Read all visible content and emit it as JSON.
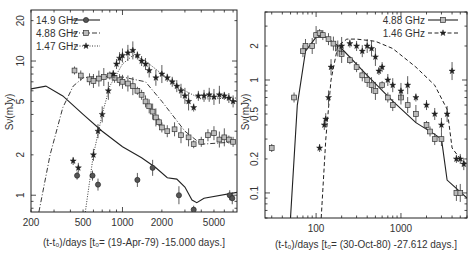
{
  "chart_data": [
    {
      "type": "scatter",
      "title": "",
      "xlabel": "(t-t0)/days [t0= (19-Apr-79) -15.000 days.]",
      "ylabel": "Sν(mJy)",
      "xscale": "log",
      "yscale": "log",
      "xlim": [
        200,
        7500
      ],
      "ylim": [
        0.75,
        24
      ],
      "xticks": [
        200,
        500,
        1000,
        2000,
        5000
      ],
      "xtick_labels": [
        "200",
        "500",
        "1000",
        "2000",
        "5000"
      ],
      "yticks": [
        1,
        2,
        5,
        10,
        20
      ],
      "ytick_labels": [
        "1",
        "2",
        "5",
        "10",
        "20"
      ],
      "grid": false,
      "legend_position": "upper left",
      "series": [
        {
          "name": "14.9 GHz",
          "marker": "circle",
          "line": "solid",
          "points": [
            [
              450,
              1.4
            ],
            [
              590,
              1.4
            ],
            [
              650,
              1.2
            ],
            [
              1300,
              1.3
            ],
            [
              1700,
              1.6
            ],
            [
              2700,
              1.0
            ],
            [
              3500,
              0.78
            ],
            [
              6600,
              1.0
            ],
            [
              6900,
              0.95
            ]
          ],
          "model": [
            [
              200,
              6.2
            ],
            [
              260,
              6.5
            ],
            [
              350,
              5.5
            ],
            [
              500,
              4.0
            ],
            [
              700,
              3.0
            ],
            [
              1000,
              2.3
            ],
            [
              1400,
              1.9
            ],
            [
              1800,
              1.6
            ],
            [
              2200,
              1.35
            ],
            [
              2600,
              1.32
            ],
            [
              3000,
              1.15
            ],
            [
              3400,
              0.92
            ],
            [
              3700,
              0.88
            ],
            [
              4200,
              0.95
            ],
            [
              7500,
              1.05
            ]
          ]
        },
        {
          "name": "4.88 GHz",
          "marker": "square",
          "line": "dashdot",
          "points": [
            [
              430,
              8.5
            ],
            [
              480,
              7.8
            ],
            [
              560,
              7.3
            ],
            [
              600,
              7.1
            ],
            [
              660,
              7.4
            ],
            [
              720,
              7.6
            ],
            [
              800,
              7.8
            ],
            [
              870,
              7.5
            ],
            [
              950,
              7.2
            ],
            [
              1000,
              7.0
            ],
            [
              1100,
              6.8
            ],
            [
              1200,
              6.5
            ],
            [
              1300,
              6.0
            ],
            [
              1400,
              5.6
            ],
            [
              1500,
              5.0
            ],
            [
              1600,
              4.6
            ],
            [
              1700,
              4.2
            ],
            [
              1800,
              3.8
            ],
            [
              1900,
              3.5
            ],
            [
              2000,
              3.2
            ],
            [
              2200,
              3.0
            ],
            [
              2500,
              3.1
            ],
            [
              2800,
              2.8
            ],
            [
              3200,
              2.7
            ],
            [
              3500,
              2.4
            ],
            [
              4000,
              2.5
            ],
            [
              4500,
              2.8
            ],
            [
              5000,
              2.9
            ],
            [
              5500,
              2.6
            ],
            [
              6000,
              2.7
            ],
            [
              6500,
              2.6
            ],
            [
              7000,
              2.5
            ]
          ],
          "model": [
            [
              230,
              0.75
            ],
            [
              280,
              2.0
            ],
            [
              350,
              4.5
            ],
            [
              420,
              6.5
            ],
            [
              500,
              7.5
            ],
            [
              650,
              7.7
            ],
            [
              1000,
              7.6
            ],
            [
              1500,
              7.0
            ],
            [
              2000,
              5.0
            ],
            [
              3000,
              3.0
            ],
            [
              4000,
              2.4
            ],
            [
              7500,
              2.5
            ]
          ]
        },
        {
          "name": "1.47 GHz",
          "marker": "star",
          "line": "dotted",
          "points": [
            [
              420,
              1.8
            ],
            [
              460,
              1.6
            ],
            [
              600,
              2.0
            ],
            [
              650,
              3.0
            ],
            [
              700,
              4.0
            ],
            [
              780,
              6.0
            ],
            [
              850,
              8.0
            ],
            [
              900,
              9.5
            ],
            [
              950,
              10.5
            ],
            [
              1000,
              11.0
            ],
            [
              1100,
              11.5
            ],
            [
              1200,
              12.0
            ],
            [
              1300,
              11.0
            ],
            [
              1400,
              10.0
            ],
            [
              1500,
              9.5
            ],
            [
              1600,
              8.5
            ],
            [
              1800,
              7.5
            ],
            [
              2000,
              8.0
            ],
            [
              2200,
              7.5
            ],
            [
              2400,
              7.0
            ],
            [
              2600,
              6.5
            ],
            [
              2800,
              6.0
            ],
            [
              3000,
              5.5
            ],
            [
              3200,
              5.0
            ],
            [
              3500,
              4.5
            ],
            [
              3800,
              5.5
            ],
            [
              4200,
              5.5
            ],
            [
              4600,
              5.6
            ],
            [
              5000,
              5.4
            ],
            [
              5500,
              5.6
            ],
            [
              6000,
              5.5
            ],
            [
              6500,
              5.3
            ],
            [
              7000,
              5.0
            ]
          ],
          "model": [
            [
              520,
              0.75
            ],
            [
              600,
              2.0
            ],
            [
              700,
              4.0
            ],
            [
              800,
              6.5
            ],
            [
              1000,
              9.5
            ],
            [
              1200,
              11.0
            ],
            [
              1500,
              10.0
            ],
            [
              2000,
              8.0
            ],
            [
              3000,
              6.0
            ],
            [
              4000,
              5.2
            ],
            [
              7500,
              5.3
            ]
          ]
        }
      ]
    },
    {
      "type": "scatter",
      "title": "",
      "xlabel": "(t-t0)/days [t0= (30-Oct-80) -27.612 days.]",
      "ylabel": "Sν(mJy)",
      "xscale": "log",
      "yscale": "log",
      "xlim": [
        25,
        6000
      ],
      "ylim": [
        0.06,
        4.0
      ],
      "xticks": [
        100,
        1000
      ],
      "xtick_labels": [
        "100",
        "1000"
      ],
      "yticks": [
        0.1,
        0.2,
        0.5,
        1,
        2
      ],
      "ytick_labels": [
        "0.1",
        "0.2",
        "0.5",
        "1",
        "2"
      ],
      "grid": false,
      "legend_position": "upper right",
      "series": [
        {
          "name": "4.88 GHz",
          "marker": "square",
          "line": "solid",
          "points": [
            [
              30,
              0.25
            ],
            [
              55,
              0.7
            ],
            [
              70,
              1.8
            ],
            [
              75,
              2.0
            ],
            [
              90,
              2.0
            ],
            [
              100,
              2.5
            ],
            [
              110,
              2.6
            ],
            [
              120,
              2.5
            ],
            [
              140,
              2.3
            ],
            [
              160,
              2.1
            ],
            [
              180,
              1.9
            ],
            [
              200,
              1.7
            ],
            [
              250,
              1.5
            ],
            [
              300,
              1.3
            ],
            [
              350,
              1.1
            ],
            [
              400,
              1.0
            ],
            [
              450,
              0.9
            ],
            [
              500,
              0.8
            ],
            [
              600,
              0.9
            ],
            [
              700,
              0.7
            ],
            [
              800,
              0.6
            ],
            [
              1000,
              0.7
            ],
            [
              1200,
              0.6
            ],
            [
              1500,
              0.5
            ],
            [
              2000,
              0.4
            ],
            [
              2200,
              0.35
            ],
            [
              2500,
              0.3
            ],
            [
              3000,
              0.3
            ],
            [
              4500,
              0.1
            ],
            [
              5000,
              0.1
            ]
          ],
          "model": [
            [
              50,
              0.06
            ],
            [
              60,
              0.6
            ],
            [
              75,
              1.8
            ],
            [
              100,
              2.4
            ],
            [
              130,
              2.4
            ],
            [
              200,
              1.9
            ],
            [
              400,
              1.1
            ],
            [
              800,
              0.65
            ],
            [
              1500,
              0.42
            ],
            [
              2500,
              0.33
            ],
            [
              3000,
              0.3
            ],
            [
              3500,
              0.13
            ],
            [
              6000,
              0.09
            ]
          ]
        },
        {
          "name": "1.46 GHz",
          "marker": "star",
          "line": "dashed",
          "points": [
            [
              110,
              0.25
            ],
            [
              125,
              0.4
            ],
            [
              130,
              0.45
            ],
            [
              140,
              0.7
            ],
            [
              150,
              1.3
            ],
            [
              200,
              2.0
            ],
            [
              250,
              2.1
            ],
            [
              300,
              2.0
            ],
            [
              350,
              1.8
            ],
            [
              400,
              2.0
            ],
            [
              450,
              1.9
            ],
            [
              500,
              1.6
            ],
            [
              550,
              1.2
            ],
            [
              600,
              1.3
            ],
            [
              700,
              1.0
            ],
            [
              800,
              0.9
            ],
            [
              1000,
              0.8
            ],
            [
              1200,
              0.9
            ],
            [
              1500,
              0.7
            ],
            [
              2000,
              0.6
            ],
            [
              2500,
              0.5
            ],
            [
              3000,
              0.4
            ],
            [
              3500,
              0.5
            ],
            [
              4000,
              1.2
            ],
            [
              4500,
              0.2
            ],
            [
              5000,
              0.2
            ],
            [
              5500,
              0.18
            ]
          ],
          "model": [
            [
              115,
              0.06
            ],
            [
              130,
              0.3
            ],
            [
              150,
              1.0
            ],
            [
              180,
              2.0
            ],
            [
              230,
              2.3
            ],
            [
              300,
              2.3
            ],
            [
              500,
              2.2
            ],
            [
              800,
              1.9
            ],
            [
              1500,
              1.3
            ],
            [
              2500,
              0.9
            ],
            [
              3500,
              0.55
            ],
            [
              4000,
              0.25
            ],
            [
              5000,
              0.2
            ],
            [
              6000,
              0.18
            ]
          ]
        }
      ]
    }
  ],
  "plots": {
    "left": {
      "ylabel": "Sν(mJy)",
      "xlabel": "(t-t₀)/days [t₀= (19-Apr-79) -15.000 days.]",
      "legend": [
        "14.9 GHz",
        "4.88 GHz",
        "1.47 GHz"
      ]
    },
    "right": {
      "ylabel": "Sν(mJy)",
      "xlabel": "(t-t₀)/days [t₀= (30-Oct-80) -27.612 days.]",
      "legend": [
        "4.88 GHz",
        "1.46 GHz"
      ]
    }
  }
}
